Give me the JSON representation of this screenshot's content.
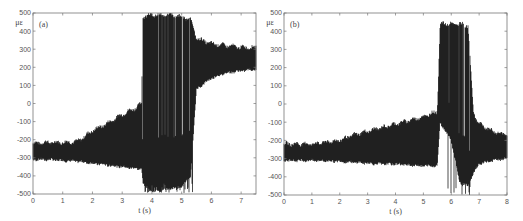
{
  "chart_data": [
    {
      "type": "line",
      "panel_label": "(a)",
      "title": "",
      "xlabel": "t (s)",
      "ylabel": "με",
      "xlim": [
        0,
        7.5
      ],
      "ylim": [
        -500,
        500
      ],
      "xticks": [
        0,
        1,
        2,
        3,
        4,
        5,
        6,
        7
      ],
      "yticks": [
        -500,
        -400,
        -300,
        -200,
        -100,
        0,
        100,
        200,
        300,
        400,
        500
      ],
      "grid": false,
      "series": [
        {
          "name": "strain",
          "description": "dense oscillation; envelope upper/lower bounds vs time",
          "x": [
            0,
            0.5,
            1.0,
            1.5,
            2.0,
            2.5,
            3.0,
            3.5,
            3.65,
            3.7,
            4.0,
            4.3,
            4.6,
            5.0,
            5.3,
            5.5,
            6.0,
            6.5,
            7.0,
            7.5
          ],
          "upper": [
            -220,
            -215,
            -215,
            -210,
            -150,
            -110,
            -60,
            -20,
            0,
            480,
            490,
            490,
            490,
            480,
            460,
            360,
            330,
            320,
            310,
            310
          ],
          "lower": [
            -310,
            -310,
            -315,
            -320,
            -330,
            -340,
            -350,
            -360,
            -360,
            -440,
            -490,
            -480,
            -470,
            -460,
            -400,
            80,
            140,
            170,
            180,
            190
          ]
        }
      ]
    },
    {
      "type": "line",
      "panel_label": "(b)",
      "title": "",
      "xlabel": "t (s)",
      "ylabel": "με",
      "xlim": [
        0,
        8
      ],
      "ylim": [
        -500,
        500
      ],
      "xticks": [
        0,
        1,
        2,
        3,
        4,
        5,
        6,
        7,
        8
      ],
      "yticks": [
        -500,
        -400,
        -300,
        -200,
        -100,
        0,
        100,
        200,
        300,
        400,
        500
      ],
      "grid": false,
      "series": [
        {
          "name": "strain",
          "description": "dense oscillation; envelope upper/lower bounds vs time",
          "x": [
            0,
            1,
            2,
            2.5,
            3,
            3.5,
            4,
            4.5,
            5,
            5.5,
            5.6,
            6.0,
            6.3,
            6.6,
            6.8,
            7.0,
            7.5,
            8.0
          ],
          "upper": [
            -220,
            -220,
            -200,
            -170,
            -150,
            -130,
            -110,
            -90,
            -70,
            -40,
            440,
            440,
            440,
            430,
            -50,
            -110,
            -150,
            -170
          ],
          "lower": [
            -310,
            -310,
            -315,
            -320,
            -325,
            -330,
            -330,
            -335,
            -340,
            -340,
            -100,
            -200,
            -430,
            -450,
            -380,
            -330,
            -310,
            -300
          ]
        }
      ]
    }
  ]
}
